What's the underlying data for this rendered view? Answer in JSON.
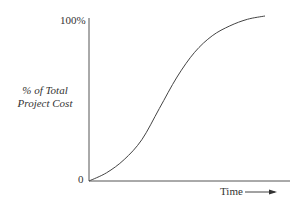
{
  "chart_data": {
    "type": "line",
    "title": "",
    "xlabel": "Time",
    "ylabel": "% of Total Project Cost",
    "y_tick_labels": [
      "0",
      "100%"
    ],
    "ylim": [
      0,
      100
    ],
    "xlim": [
      0,
      100
    ],
    "grid": false,
    "legend": null,
    "series": [
      {
        "name": "Cumulative project cost (S-curve)",
        "x": [
          0,
          10,
          20,
          30,
          40,
          50,
          60,
          70,
          80,
          90,
          100
        ],
        "y": [
          0,
          5,
          13,
          25,
          44,
          63,
          78,
          88,
          94,
          98,
          100
        ]
      }
    ]
  },
  "labels": {
    "y_top": "100%",
    "y_zero": "0",
    "y_title_line1": "% of Total",
    "y_title_line2": "Project Cost",
    "x_title": "Time"
  }
}
